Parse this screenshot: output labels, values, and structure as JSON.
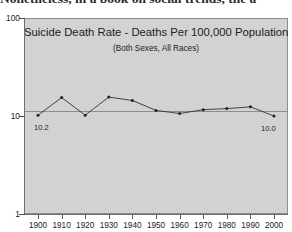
{
  "page": {
    "prose_line": "Nonetheless, in a book on social trends, the a"
  },
  "figure": {
    "title": "Suicide Death Rate - Deaths Per 100,000 Population",
    "subtitle": "(Both Sexes, All Races)",
    "panel_color": "#d2d2d2",
    "series_color": "#333333"
  },
  "chart_data": {
    "type": "line",
    "title": "Suicide Death Rate - Deaths Per 100,000 Population",
    "subtitle": "(Both Sexes, All Races)",
    "xlabel": "",
    "ylabel": "",
    "yscale": "log",
    "ylim": [
      1,
      100
    ],
    "grid": false,
    "legend": null,
    "x": [
      1900,
      1910,
      1920,
      1930,
      1940,
      1950,
      1960,
      1970,
      1980,
      1990,
      2000
    ],
    "xticklabels": [
      "1900",
      "1910",
      "1920",
      "1930",
      "1940",
      "1950",
      "1960",
      "1970",
      "1980",
      "1990",
      "2000"
    ],
    "yticks": [
      1,
      10,
      100
    ],
    "yticklabels": [
      "1",
      "10",
      "100"
    ],
    "values": [
      10.2,
      15.4,
      10.2,
      15.6,
      14.4,
      11.4,
      10.6,
      11.6,
      11.9,
      12.4,
      10.0
    ],
    "annotations": [
      {
        "text": "10.2",
        "x": 1900,
        "y": 10.2
      },
      {
        "text": "10.0",
        "x": 2000,
        "y": 10.0
      }
    ]
  }
}
